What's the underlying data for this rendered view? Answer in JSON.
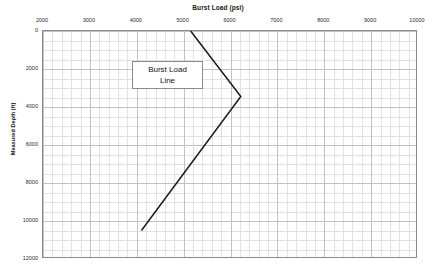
{
  "chart_data": {
    "type": "line",
    "title": "Burst Load (psi)",
    "xlabel": "Burst Load (psi)",
    "ylabel": "Measured Depth (ft)",
    "xlim": [
      2000,
      10000
    ],
    "ylim": [
      0,
      12000
    ],
    "y_inverted": true,
    "grid": true,
    "legend": "none",
    "x_ticks": [
      2000,
      3000,
      4000,
      5000,
      6000,
      7000,
      8000,
      9000,
      10000
    ],
    "x_tick_labels": [
      "2000",
      "3000",
      "4000",
      "5000",
      "6000",
      "7000",
      "8000",
      "9000",
      "10000"
    ],
    "x_minor_step": 200,
    "y_ticks": [
      0,
      2000,
      4000,
      6000,
      8000,
      10000,
      12000
    ],
    "y_tick_labels": [
      "0",
      "2000",
      "4000",
      "6000",
      "8000",
      "10000",
      "12000"
    ],
    "y_minor_step": 500,
    "series": [
      {
        "name": "Burst Load Line",
        "color": "#1a1a1a",
        "line_width": 1.5,
        "points": [
          {
            "x": 5150,
            "y": 0
          },
          {
            "x": 6220,
            "y": 3450
          },
          {
            "x": 4100,
            "y": 10500
          }
        ]
      }
    ],
    "annotations": [
      {
        "text_line_1": "Burst Load",
        "text_line_2": "Line",
        "x": 3900,
        "y": 2050,
        "boxed": true,
        "box_border_color": "#8a8a8a",
        "box_fill_color": "#ffffff"
      }
    ]
  },
  "colors": {
    "line": "#1a1a1a",
    "major_grid": "#c2c2c2",
    "minor_grid": "#e2e2e2",
    "frame": "#8a8a8a",
    "text": "#202020",
    "background": "#ffffff"
  }
}
